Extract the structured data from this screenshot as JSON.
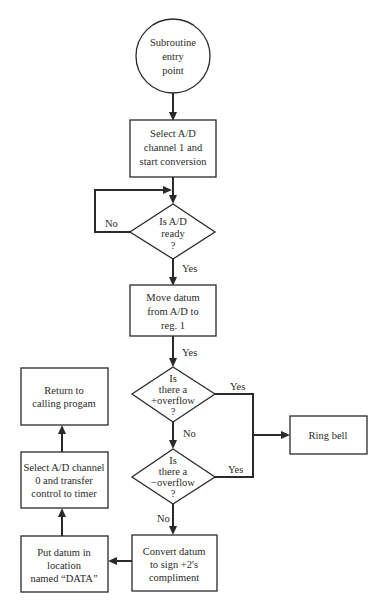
{
  "diagram": {
    "type": "flowchart",
    "nodes": {
      "start": {
        "kind": "terminal-circle",
        "lines": [
          "Subroutine",
          "entry",
          "point"
        ]
      },
      "select_ch1": {
        "kind": "process",
        "lines": [
          "Select A/D",
          "channel 1 and",
          "start conversion"
        ]
      },
      "ad_ready": {
        "kind": "decision",
        "lines": [
          "Is A/D",
          "ready",
          "?"
        ]
      },
      "move_datum": {
        "kind": "process",
        "lines": [
          "Move datum",
          "from A/D to",
          "reg. 1"
        ]
      },
      "pos_overflow": {
        "kind": "decision",
        "lines": [
          "Is",
          "there a",
          "+overflow",
          "?"
        ]
      },
      "neg_overflow": {
        "kind": "decision",
        "lines": [
          "Is",
          "there a",
          "−overflow",
          "?"
        ]
      },
      "ring_bell": {
        "kind": "process",
        "lines": [
          "Ring bell"
        ]
      },
      "convert": {
        "kind": "process",
        "lines": [
          "Convert datum",
          "to sign +2's",
          "compliment"
        ]
      },
      "put_datum": {
        "kind": "process",
        "lines": [
          "Put datum in",
          "location",
          "named “DATA”"
        ]
      },
      "select_ch0": {
        "kind": "process",
        "lines": [
          "Select A/D channel",
          "0 and transfer",
          "control to timer"
        ]
      },
      "return": {
        "kind": "process",
        "lines": [
          "Return to",
          "calling progam"
        ]
      }
    },
    "edges": [
      {
        "from": "start",
        "to": "select_ch1",
        "label": ""
      },
      {
        "from": "select_ch1",
        "to": "ad_ready",
        "label": ""
      },
      {
        "from": "ad_ready",
        "to": "ad_ready",
        "label": "No"
      },
      {
        "from": "ad_ready",
        "to": "move_datum",
        "label": "Yes"
      },
      {
        "from": "move_datum",
        "to": "pos_overflow",
        "label": "Yes"
      },
      {
        "from": "pos_overflow",
        "to": "ring_bell",
        "label": "Yes"
      },
      {
        "from": "pos_overflow",
        "to": "neg_overflow",
        "label": "No"
      },
      {
        "from": "neg_overflow",
        "to": "ring_bell",
        "label": "Yes"
      },
      {
        "from": "neg_overflow",
        "to": "convert",
        "label": "No"
      },
      {
        "from": "convert",
        "to": "put_datum",
        "label": ""
      },
      {
        "from": "put_datum",
        "to": "select_ch0",
        "label": ""
      },
      {
        "from": "select_ch0",
        "to": "return",
        "label": ""
      }
    ],
    "labels": {
      "no_loop": "No",
      "yes_ready": "Yes",
      "yes_move": "Yes",
      "yes_pos": "Yes",
      "no_pos": "No",
      "yes_neg": "Yes",
      "no_neg": "No"
    }
  }
}
